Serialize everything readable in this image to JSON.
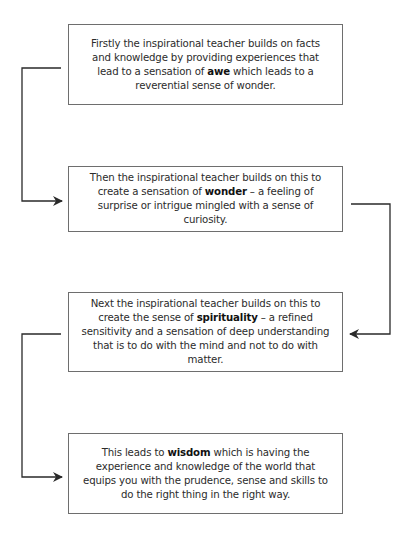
{
  "diagram": {
    "type": "flowchart",
    "line_color": "#2a2a2a",
    "border_color": "#6e6e6e",
    "steps": [
      {
        "pre": "Firstly the inspirational teacher builds on facts and knowledge by providing experiences that lead to a sensation of ",
        "keyword": "awe",
        "post": " which leads to a reverential sense of wonder."
      },
      {
        "pre": "Then the inspirational teacher builds on this to create a sensation of ",
        "keyword": "wonder",
        "post": " – a feeling of surprise or intrigue mingled with a sense of curiosity."
      },
      {
        "pre": "Next the inspirational teacher builds on this to create the sense of ",
        "keyword": "spirituality",
        "post": " – a refined sensitivity and a sensation of deep understanding that is to do with the mind and not to do with matter."
      },
      {
        "pre": "This leads to ",
        "keyword": "wisdom",
        "post": " which is having the experience and knowledge of the world that equips you with the prudence, sense and skills to do the right thing in the right way."
      }
    ],
    "connectors": [
      {
        "from": "step-1",
        "to": "step-2",
        "side": "left"
      },
      {
        "from": "step-2",
        "to": "step-3",
        "side": "right"
      },
      {
        "from": "step-3",
        "to": "step-4",
        "side": "left"
      }
    ]
  }
}
